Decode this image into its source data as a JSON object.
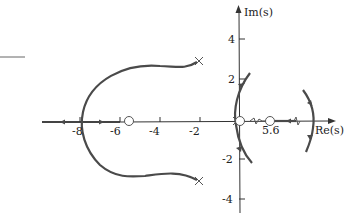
{
  "diagram": {
    "type": "root-locus",
    "axes": {
      "x_label": "Re(s)",
      "y_label": "Im(s)",
      "x_ticks": [
        "-8",
        "-6",
        "-4",
        "-2"
      ],
      "y_ticks": [
        "4",
        "2",
        "-2",
        "-4"
      ],
      "extra_x_label": "5.6"
    },
    "poles": [
      {
        "re": -2,
        "im": 3
      },
      {
        "re": -2,
        "im": -3
      },
      {
        "re": 0,
        "im": 0
      }
    ],
    "zeros": [
      {
        "re": -5.6,
        "im": 0
      },
      {
        "re": 0,
        "im": 0
      },
      {
        "re": 5.6,
        "im": 0
      }
    ],
    "colors": {
      "locus": "#4a4a4a",
      "axis": "#333333",
      "text": "#222222"
    }
  }
}
